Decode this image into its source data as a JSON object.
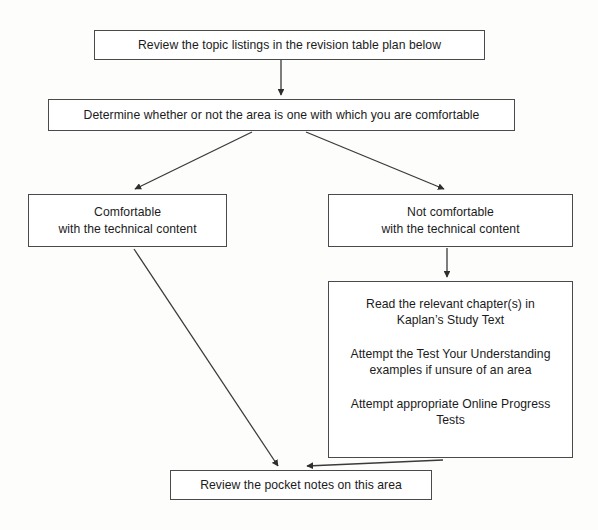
{
  "diagram": {
    "type": "flowchart",
    "colors": {
      "background": "#ffffff",
      "box_border": "#4a4a4a",
      "box_fill": "#ffffff",
      "text": "#1b1b1b",
      "connector": "#3a3a3a"
    },
    "nodes": {
      "review_topics": {
        "id": "review-topics",
        "shape": "rectangle",
        "lines": [
          "Review the topic listings in the revision table plan below"
        ]
      },
      "determine_area": {
        "id": "determine-area",
        "shape": "rectangle",
        "lines": [
          "Determine whether or not the area is one with which you are comfortable"
        ]
      },
      "comfortable": {
        "id": "comfortable",
        "shape": "rectangle",
        "lines": [
          "Comfortable",
          "with the technical content"
        ]
      },
      "not_comfortable": {
        "id": "not-comfortable",
        "shape": "rectangle",
        "lines": [
          "Not comfortable",
          "with the technical content"
        ]
      },
      "study_actions": {
        "id": "study-actions",
        "shape": "rectangle",
        "paragraphs": [
          {
            "lines": [
              "Read the relevant chapter(s) in",
              "Kaplan’s Study Text"
            ]
          },
          {
            "lines": [
              "Attempt the Test Your Understanding",
              "examples if unsure of an area"
            ]
          },
          {
            "lines": [
              "Attempt appropriate Online Progress",
              "Tests"
            ]
          }
        ]
      },
      "pocket_notes": {
        "id": "pocket-notes",
        "shape": "rectangle",
        "lines": [
          "Review the pocket notes on this area"
        ]
      }
    },
    "edges": [
      {
        "id": "review-to-determine",
        "from": "review_topics",
        "to": "determine_area",
        "style": "straight-vertical",
        "arrowhead": "filled-triangle"
      },
      {
        "id": "determine-to-comfortable",
        "from": "determine_area",
        "to": "comfortable",
        "style": "diagonal-left",
        "arrowhead": "filled-triangle"
      },
      {
        "id": "determine-to-not-comfortable",
        "from": "determine_area",
        "to": "not_comfortable",
        "style": "diagonal-right",
        "arrowhead": "filled-triangle"
      },
      {
        "id": "not-comfortable-to-study",
        "from": "not_comfortable",
        "to": "study_actions",
        "style": "straight-vertical",
        "arrowhead": "filled-triangle"
      },
      {
        "id": "comfortable-to-pocket-notes",
        "from": "comfortable",
        "to": "pocket_notes",
        "style": "long-diagonal",
        "arrowhead": "filled-triangle"
      },
      {
        "id": "study-to-pocket-notes",
        "from": "study_actions",
        "to": "pocket_notes",
        "style": "diagonal-left",
        "arrowhead": "filled-triangle"
      }
    ]
  }
}
